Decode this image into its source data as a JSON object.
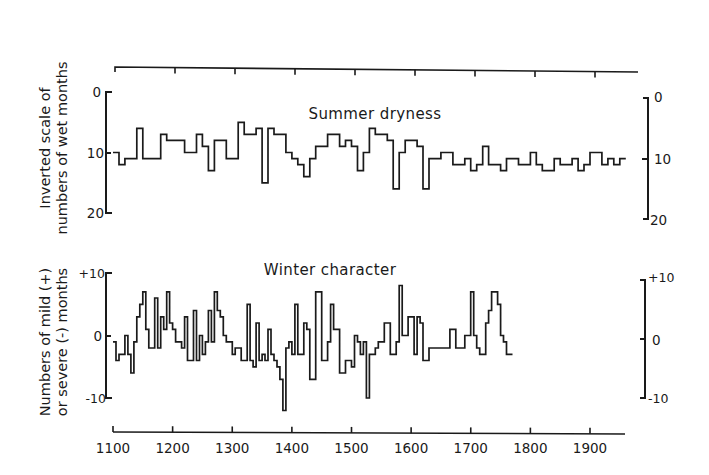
{
  "chart_data": [
    {
      "type": "line",
      "subtype": "step",
      "title": "Summer dryness",
      "ylabel": "Inverted scale of numbers of wet months",
      "ylabel_lines": [
        "Inverted scale of",
        "numbers of wet months"
      ],
      "y_inverted": true,
      "ylim": [
        0,
        20
      ],
      "yticks": [
        0,
        10,
        20
      ],
      "ytick_labels": [
        "0",
        "10",
        "20"
      ],
      "xlim": [
        1100,
        1960
      ],
      "decade_start": 1100,
      "decade_step": 10,
      "values": [
        10,
        12,
        11,
        11,
        6,
        11,
        11,
        11,
        7,
        8,
        8,
        8,
        10,
        10,
        7,
        9,
        13,
        8,
        8,
        11,
        11,
        5,
        7,
        7,
        6,
        15,
        6,
        7,
        7,
        10,
        11,
        12,
        14,
        11,
        9,
        9,
        7,
        7,
        9,
        8,
        9,
        13,
        10,
        6,
        7,
        7,
        8,
        16,
        10,
        8,
        8,
        9,
        16,
        11,
        11,
        10,
        10,
        12,
        12,
        11,
        13,
        12,
        9,
        12,
        12,
        13,
        11,
        11,
        12,
        12,
        10,
        12,
        13,
        13,
        11,
        12,
        12,
        11,
        13,
        12,
        10,
        10,
        12,
        11,
        12,
        11
      ],
      "grid": false
    },
    {
      "type": "line",
      "subtype": "step",
      "title": "Winter character",
      "ylabel": "Numbers of mild (+) or severe (-) months",
      "ylabel_lines": [
        "Numbers of mild (+)",
        "or severe (-) months"
      ],
      "ylim": [
        -10,
        10
      ],
      "yticks": [
        10,
        0,
        -10
      ],
      "ytick_labels": [
        "+10",
        "0",
        "-10"
      ],
      "xlim": [
        1100,
        1960
      ],
      "xticks": [
        1100,
        1200,
        1300,
        1400,
        1500,
        1600,
        1700,
        1800,
        1900
      ],
      "xtick_labels": [
        "1100",
        "1200",
        "1300",
        "1400",
        "1500",
        "1600",
        "1700",
        "1800",
        "1900"
      ],
      "decade_start": 1100,
      "decade_step": 10,
      "values": [
        -1,
        -4,
        -3,
        -3,
        0,
        -3,
        -6,
        -1,
        3,
        5,
        7,
        1,
        -2,
        -2,
        6,
        -2,
        3,
        1,
        7,
        2,
        1,
        -1,
        -1,
        -2,
        3,
        -4,
        -4,
        4,
        -4,
        0,
        -3,
        -1,
        4,
        -1,
        7,
        4,
        3,
        0,
        -1,
        -1,
        -3,
        -2,
        -2,
        -4,
        -4,
        5,
        -4,
        -5,
        2,
        -4,
        -3,
        -4,
        1,
        -3,
        -4,
        -5,
        -7,
        -12,
        -2,
        -1,
        -3,
        5,
        -3,
        -3,
        2,
        1,
        -7,
        -7,
        7,
        7,
        -4,
        -4,
        -1,
        5,
        1,
        1,
        -6,
        -6,
        -4,
        -4,
        -5,
        0,
        -1,
        -3,
        -1,
        -10,
        -3,
        -3,
        -2,
        -1,
        -1,
        2,
        2,
        -3,
        -3,
        -1,
        8,
        0,
        0,
        3,
        3,
        -3,
        3,
        2,
        -4,
        -4,
        -2,
        -2,
        -2,
        -2,
        -2,
        -2,
        -2,
        1,
        1,
        -2,
        -2,
        -2,
        0,
        0,
        7,
        0,
        -2,
        -3,
        -3,
        2,
        4,
        7,
        7,
        5,
        0,
        -1,
        -3,
        -3
      ],
      "values_note": "half-decade resolution (5-year steps) for winter series",
      "value_step_years": 5,
      "grid": false
    }
  ],
  "axes": {
    "top_axis": {
      "ticks": 9,
      "labels": []
    },
    "bottom_axis_labels": [
      "1100",
      "1200",
      "1300",
      "1400",
      "1500",
      "1600",
      "1700",
      "1800",
      "1900"
    ]
  },
  "panels": {
    "summer": {
      "title": "Summer dryness",
      "ylabel_line1": "Inverted scale of",
      "ylabel_line2": "numbers of wet months",
      "left_ticks": [
        "0",
        "10",
        "20"
      ],
      "right_ticks": [
        "0",
        "10",
        "20"
      ]
    },
    "winter": {
      "title": "Winter character",
      "ylabel_line1": "Numbers of mild (+)",
      "ylabel_line2": "or severe (-) months",
      "left_ticks": [
        "+10",
        "0",
        "-10"
      ],
      "right_ticks": [
        "+10",
        "0",
        "-10"
      ]
    }
  },
  "style": {
    "ink": "#1a1a1a",
    "background": "#ffffff"
  }
}
